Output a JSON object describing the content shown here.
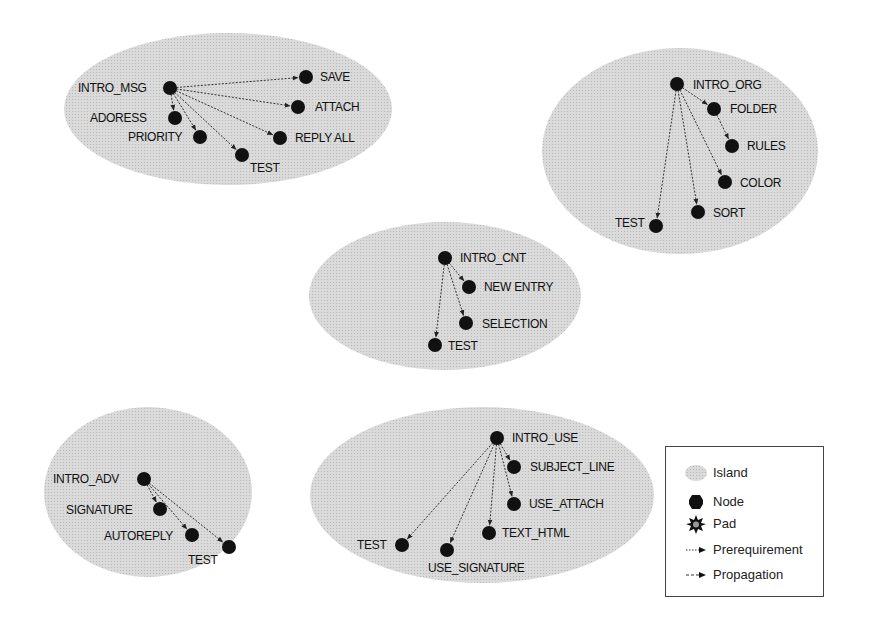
{
  "diagram": {
    "colors": {
      "island_fill": "#d6d6d6",
      "node_fill": "#111111",
      "edge": "#333333",
      "background": "#ffffff"
    },
    "islands": [
      {
        "id": "msg",
        "cx": 228,
        "cy": 109,
        "rx": 164,
        "ry": 76,
        "nodes": [
          {
            "id": "INTRO_MSG",
            "label": "INTRO_MSG",
            "x": 170,
            "y": 88,
            "lx": 78,
            "ly": 92,
            "anchor": "start"
          },
          {
            "id": "SAVE",
            "label": "SAVE",
            "x": 306,
            "y": 77,
            "lx": 320,
            "ly": 81,
            "anchor": "start"
          },
          {
            "id": "ATTACH",
            "label": "ATTACH",
            "x": 298,
            "y": 107,
            "lx": 315,
            "ly": 111,
            "anchor": "start"
          },
          {
            "id": "ADDRESS",
            "label": "ADORESS",
            "x": 175,
            "y": 118,
            "lx": 90,
            "ly": 122,
            "anchor": "start"
          },
          {
            "id": "PRIORITY",
            "label": "PRIORITY",
            "x": 200,
            "y": 137,
            "lx": 128,
            "ly": 141,
            "anchor": "start"
          },
          {
            "id": "REPLY_ALL",
            "label": "REPLY ALL",
            "x": 280,
            "y": 138,
            "lx": 295,
            "ly": 142,
            "anchor": "start"
          },
          {
            "id": "TEST_MSG",
            "label": "TEST",
            "x": 242,
            "y": 155,
            "lx": 250,
            "ly": 172,
            "anchor": "start"
          }
        ],
        "edges": [
          [
            "INTRO_MSG",
            "SAVE"
          ],
          [
            "INTRO_MSG",
            "ATTACH"
          ],
          [
            "INTRO_MSG",
            "ADDRESS"
          ],
          [
            "INTRO_MSG",
            "PRIORITY"
          ],
          [
            "INTRO_MSG",
            "REPLY_ALL"
          ],
          [
            "INTRO_MSG",
            "TEST_MSG"
          ]
        ]
      },
      {
        "id": "org",
        "cx": 680,
        "cy": 151,
        "rx": 138,
        "ry": 103,
        "nodes": [
          {
            "id": "INTRO_ORG",
            "label": "INTRO_ORG",
            "x": 677,
            "y": 84,
            "lx": 693,
            "ly": 89,
            "anchor": "start"
          },
          {
            "id": "FOLDER",
            "label": "FOLDER",
            "x": 714,
            "y": 109,
            "lx": 730,
            "ly": 113,
            "anchor": "start"
          },
          {
            "id": "RULES",
            "label": "RULES",
            "x": 732,
            "y": 146,
            "lx": 747,
            "ly": 150,
            "anchor": "start"
          },
          {
            "id": "COLOR",
            "label": "COLOR",
            "x": 725,
            "y": 182,
            "lx": 740,
            "ly": 187,
            "anchor": "start"
          },
          {
            "id": "SORT",
            "label": "SORT",
            "x": 698,
            "y": 212,
            "lx": 713,
            "ly": 217,
            "anchor": "start"
          },
          {
            "id": "TEST_ORG",
            "label": "TEST",
            "x": 656,
            "y": 226,
            "lx": 615,
            "ly": 227,
            "anchor": "start"
          }
        ],
        "edges": [
          [
            "INTRO_ORG",
            "FOLDER"
          ],
          [
            "FOLDER",
            "RULES"
          ],
          [
            "INTRO_ORG",
            "COLOR"
          ],
          [
            "INTRO_ORG",
            "SORT"
          ],
          [
            "INTRO_ORG",
            "TEST_ORG"
          ]
        ]
      },
      {
        "id": "cnt",
        "cx": 445,
        "cy": 296,
        "rx": 136,
        "ry": 74,
        "nodes": [
          {
            "id": "INTRO_CNT",
            "label": "INTRO_CNT",
            "x": 445,
            "y": 258,
            "lx": 460,
            "ly": 262,
            "anchor": "start"
          },
          {
            "id": "NEW_ENTRY",
            "label": "NEW ENTRY",
            "x": 469,
            "y": 287,
            "lx": 484,
            "ly": 291,
            "anchor": "start"
          },
          {
            "id": "SELECTION",
            "label": "SELECTION",
            "x": 466,
            "y": 323,
            "lx": 482,
            "ly": 328,
            "anchor": "start"
          },
          {
            "id": "TEST_CNT",
            "label": "TEST",
            "x": 435,
            "y": 345,
            "lx": 448,
            "ly": 350,
            "anchor": "start"
          }
        ],
        "edges": [
          [
            "INTRO_CNT",
            "NEW_ENTRY"
          ],
          [
            "INTRO_CNT",
            "SELECTION"
          ],
          [
            "INTRO_CNT",
            "TEST_CNT"
          ]
        ]
      },
      {
        "id": "adv",
        "cx": 148,
        "cy": 492,
        "rx": 104,
        "ry": 85,
        "nodes": [
          {
            "id": "INTRO_ADV",
            "label": "INTRO_ADV",
            "x": 144,
            "y": 479,
            "lx": 53,
            "ly": 483,
            "anchor": "start"
          },
          {
            "id": "SIGNATURE",
            "label": "SIGNATURE",
            "x": 160,
            "y": 509,
            "lx": 66,
            "ly": 514,
            "anchor": "start"
          },
          {
            "id": "AUTOREPLY",
            "label": "AUTOREPLY",
            "x": 192,
            "y": 535,
            "lx": 104,
            "ly": 540,
            "anchor": "start"
          },
          {
            "id": "TEST_ADV",
            "label": "TEST",
            "x": 229,
            "y": 547,
            "lx": 188,
            "ly": 564,
            "anchor": "start"
          }
        ],
        "edges": [
          [
            "INTRO_ADV",
            "SIGNATURE"
          ],
          [
            "INTRO_ADV",
            "AUTOREPLY"
          ],
          [
            "INTRO_ADV",
            "TEST_ADV"
          ]
        ]
      },
      {
        "id": "use",
        "cx": 482,
        "cy": 495,
        "rx": 172,
        "ry": 88,
        "nodes": [
          {
            "id": "INTRO_USE",
            "label": "INTRO_USE",
            "x": 497,
            "y": 438,
            "lx": 512,
            "ly": 442,
            "anchor": "start"
          },
          {
            "id": "SUBJECT_LINE",
            "label": "SUBJECT_LINE",
            "x": 514,
            "y": 467,
            "lx": 530,
            "ly": 471,
            "anchor": "start"
          },
          {
            "id": "USE_ATTACH",
            "label": "USE_ATTACH",
            "x": 514,
            "y": 504,
            "lx": 529,
            "ly": 508,
            "anchor": "start"
          },
          {
            "id": "TEXT_HTML",
            "label": "TEXT_HTML",
            "x": 489,
            "y": 533,
            "lx": 502,
            "ly": 537,
            "anchor": "start"
          },
          {
            "id": "USE_SIGNATURE",
            "label": "USE_SIGNATURE",
            "x": 447,
            "y": 550,
            "lx": 428,
            "ly": 572,
            "anchor": "start"
          },
          {
            "id": "TEST_USE",
            "label": "TEST",
            "x": 402,
            "y": 545,
            "lx": 357,
            "ly": 549,
            "anchor": "start"
          }
        ],
        "edges": [
          [
            "INTRO_USE",
            "SUBJECT_LINE"
          ],
          [
            "INTRO_USE",
            "USE_ATTACH"
          ],
          [
            "INTRO_USE",
            "TEXT_HTML"
          ],
          [
            "INTRO_USE",
            "USE_SIGNATURE"
          ],
          [
            "INTRO_USE",
            "TEST_USE"
          ]
        ]
      }
    ]
  },
  "legend": {
    "items": [
      {
        "icon": "island-icon",
        "label": "Island"
      },
      {
        "icon": "node-icon",
        "label": "Node"
      },
      {
        "icon": "pad-icon",
        "label": "Pad"
      },
      {
        "icon": "prerequirement-arrow-icon",
        "label": "Prerequirement"
      },
      {
        "icon": "propagation-arrow-icon",
        "label": "Propagation"
      }
    ]
  }
}
